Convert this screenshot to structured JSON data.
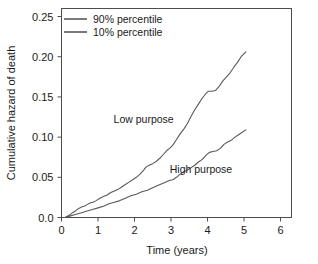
{
  "chart_data": {
    "type": "line",
    "title": "",
    "xlabel": "Time (years)",
    "ylabel": "Cumulative hazard of death",
    "xlim": [
      0,
      6.3
    ],
    "ylim": [
      0.0,
      0.26
    ],
    "xticks": [
      "0",
      "1",
      "2",
      "3",
      "4",
      "5",
      "6"
    ],
    "xtick_values": [
      0,
      1,
      2,
      3,
      4,
      5,
      6
    ],
    "yticks": [
      "0.0",
      "0.05",
      "0.10",
      "0.15",
      "0.20",
      "0.25"
    ],
    "ytick_values": [
      0.0,
      0.05,
      0.1,
      0.15,
      0.2,
      0.25
    ],
    "grid": false,
    "legend_position": "top-left",
    "legend": [
      {
        "label": "90% percentile",
        "color": "#595959"
      },
      {
        "label": "10% percentile",
        "color": "#595959"
      }
    ],
    "annotations": [
      {
        "text": "Low purpose",
        "x": 2.25,
        "y": 0.118
      },
      {
        "text": "High purpose",
        "x": 3.82,
        "y": 0.055
      }
    ],
    "series": [
      {
        "name": "90% percentile",
        "annotation": "Low purpose",
        "color": "#595959",
        "x": [
          0.1,
          0.22,
          0.3,
          0.38,
          0.46,
          0.55,
          0.62,
          0.7,
          0.78,
          0.86,
          0.95,
          1.05,
          1.15,
          1.25,
          1.35,
          1.45,
          1.55,
          1.65,
          1.75,
          1.85,
          1.95,
          2.05,
          2.15,
          2.25,
          2.32,
          2.4,
          2.5,
          2.6,
          2.7,
          2.8,
          2.88,
          2.96,
          3.05,
          3.15,
          3.25,
          3.35,
          3.45,
          3.55,
          3.65,
          3.75,
          3.85,
          3.95,
          4.02,
          4.12,
          4.22,
          4.32,
          4.42,
          4.52,
          4.62,
          4.72,
          4.82,
          4.92,
          5.05
        ],
        "y": [
          0.0,
          0.003,
          0.006,
          0.008,
          0.011,
          0.013,
          0.014,
          0.016,
          0.018,
          0.019,
          0.021,
          0.024,
          0.026,
          0.028,
          0.031,
          0.033,
          0.035,
          0.038,
          0.041,
          0.044,
          0.047,
          0.05,
          0.054,
          0.059,
          0.063,
          0.065,
          0.067,
          0.07,
          0.074,
          0.079,
          0.083,
          0.086,
          0.09,
          0.097,
          0.104,
          0.11,
          0.117,
          0.126,
          0.134,
          0.141,
          0.148,
          0.154,
          0.157,
          0.157,
          0.158,
          0.163,
          0.17,
          0.175,
          0.18,
          0.187,
          0.193,
          0.2,
          0.206
        ]
      },
      {
        "name": "10% percentile",
        "annotation": "High purpose",
        "color": "#595959",
        "x": [
          0.1,
          0.25,
          0.4,
          0.55,
          0.7,
          0.85,
          1.0,
          1.15,
          1.3,
          1.45,
          1.6,
          1.75,
          1.9,
          2.05,
          2.2,
          2.35,
          2.5,
          2.65,
          2.8,
          2.95,
          3.05,
          3.15,
          3.25,
          3.35,
          3.45,
          3.55,
          3.65,
          3.75,
          3.85,
          3.95,
          4.05,
          4.15,
          4.25,
          4.35,
          4.45,
          4.55,
          4.65,
          4.75,
          4.85,
          4.95,
          5.05
        ],
        "y": [
          0.0,
          0.002,
          0.004,
          0.006,
          0.008,
          0.01,
          0.012,
          0.014,
          0.017,
          0.019,
          0.021,
          0.024,
          0.027,
          0.029,
          0.032,
          0.034,
          0.037,
          0.04,
          0.043,
          0.046,
          0.047,
          0.05,
          0.054,
          0.057,
          0.059,
          0.062,
          0.065,
          0.069,
          0.072,
          0.077,
          0.081,
          0.082,
          0.083,
          0.086,
          0.091,
          0.094,
          0.096,
          0.1,
          0.103,
          0.106,
          0.109
        ]
      }
    ]
  },
  "axes": {
    "x_title": "Time (years)",
    "y_title": "Cumulative hazard of death"
  },
  "colors": {
    "line": "#595959",
    "frame": "#4d4d4d",
    "text": "#1a1a1a",
    "background": "#ffffff"
  }
}
